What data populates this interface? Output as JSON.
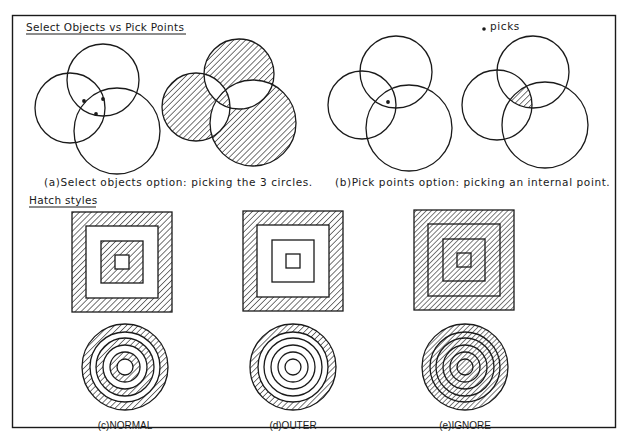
{
  "figure": {
    "section_1": {
      "heading": "Select Objects vs Pick Points",
      "legend": {
        "symbol": "dot",
        "label": "picks"
      },
      "panel_a": {
        "caption": "(a)Select objects option: picking the 3 circles.",
        "before": {
          "circles": [
            {
              "cx": 103,
              "cy": 80,
              "r": 36
            },
            {
              "cx": 70,
              "cy": 108,
              "r": 35
            },
            {
              "cx": 117,
              "cy": 131,
              "r": 43
            }
          ],
          "picks": [
            {
              "x": 84,
              "y": 101
            },
            {
              "x": 103,
              "y": 99
            },
            {
              "x": 96,
              "y": 114
            }
          ]
        },
        "after": {
          "circles": [
            {
              "cx": 239,
              "cy": 74,
              "r": 35
            },
            {
              "cx": 196,
              "cy": 107,
              "r": 34
            },
            {
              "cx": 253,
              "cy": 123,
              "r": 43
            }
          ],
          "fill_rule": "evenodd"
        }
      },
      "panel_b": {
        "caption": "(b)Pick points option: picking an internal point.",
        "before": {
          "circles": [
            {
              "cx": 396,
              "cy": 72,
              "r": 36
            },
            {
              "cx": 362,
              "cy": 105,
              "r": 34
            },
            {
              "cx": 409,
              "cy": 128,
              "r": 43
            }
          ],
          "picks": [
            {
              "x": 388,
              "y": 102
            }
          ]
        },
        "after": {
          "circles": [
            {
              "cx": 533,
              "cy": 72,
              "r": 36
            },
            {
              "cx": 497,
              "cy": 105,
              "r": 35
            },
            {
              "cx": 545,
              "cy": 125,
              "r": 43
            }
          ],
          "hatched_region": "intersection of all three circles"
        }
      }
    },
    "section_2": {
      "heading": "Hatch styles",
      "styles": [
        {
          "id": "c",
          "label": "(c)NORMAL",
          "square_center": {
            "x": 122,
            "y": 262
          },
          "circle_center": {
            "x": 125,
            "y": 367
          },
          "description": "alternating hatch"
        },
        {
          "id": "d",
          "label": "(d)OUTER",
          "square_center": {
            "x": 293,
            "y": 261
          },
          "circle_center": {
            "x": 293,
            "y": 367
          },
          "description": "outermost area only"
        },
        {
          "id": "e",
          "label": "(e)IGNORE",
          "square_center": {
            "x": 464,
            "y": 260
          },
          "circle_center": {
            "x": 465,
            "y": 367
          },
          "description": "everything hatched"
        }
      ],
      "square_half_sizes": [
        50,
        36,
        21,
        7
      ],
      "circle_radii": [
        43,
        35,
        29,
        22,
        15,
        8
      ]
    },
    "colors": {
      "ink": "#1a1a1a",
      "paper": "#ffffff"
    }
  }
}
